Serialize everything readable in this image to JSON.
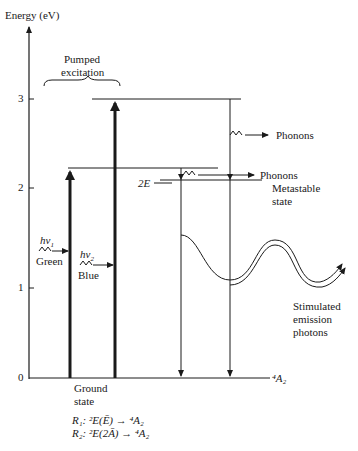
{
  "axis": {
    "label": "Energy (eV)",
    "ticks": [
      "0",
      "1",
      "2",
      "3"
    ]
  },
  "annotations": {
    "pumped_excitation_line1": "Pumped",
    "pumped_excitation_line2": "excitation",
    "phonons_upper": "Phonons",
    "phonons_lower": "Phonons",
    "level_2E": "2E",
    "metastable_line1": "Metastable",
    "metastable_line2": "state",
    "hv1": "hν",
    "hv1_sub": "1",
    "green": "Green",
    "hv2": "hν",
    "hv2_sub": "2",
    "blue": "Blue",
    "stimulated_line1": "Stimulated",
    "stimulated_line2": "emission",
    "stimulated_line3": "photons",
    "ground_line1": "Ground",
    "ground_line2": "state",
    "ground_level": "⁴A₂",
    "r1": "R₁: ²E(Ē) → ⁴A₂",
    "r2": "R₂: ²E(2Ā) → ⁴A₂"
  },
  "colors": {
    "ink": "#1a1a1a",
    "background": "#ffffff"
  }
}
